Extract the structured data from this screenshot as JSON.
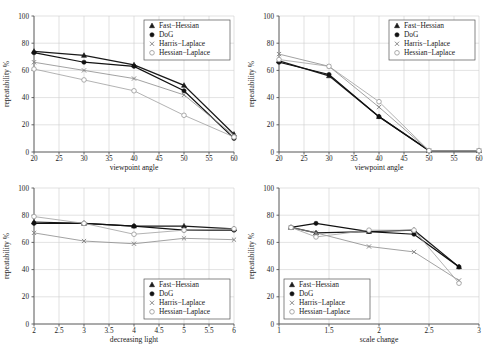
{
  "figure": {
    "series_names": [
      "Fast-Hessian",
      "DoG",
      "Harris-Laplace",
      "Hessian-Laplace"
    ],
    "legend_labels": {
      "fast_hessian": "Fast−Hessian",
      "dog": "DoG",
      "harris_laplace": "Harris−Laplace",
      "hessian_laplace": "Hessian−Laplace"
    },
    "markers": {
      "fast_hessian": "filled-triangle",
      "dog": "filled-circle",
      "harris_laplace": "cross-x",
      "hessian_laplace": "open-circle"
    },
    "colors": {
      "fast_hessian": "#1a1a1a",
      "dog": "#111111",
      "harris_laplace": "#8a8a8a",
      "hessian_laplace": "#a0a0a0",
      "grid": "#cfcfcf",
      "axis": "#555555",
      "background": "#ffffff"
    },
    "ylabel": "repeatability %",
    "yticks": [
      "0",
      "20",
      "40",
      "60",
      "80",
      "100"
    ]
  },
  "chart_data": [
    {
      "id": "viewpoint-angle-graffiti",
      "type": "line",
      "title": "",
      "xlabel": "viewpoint angle",
      "ylabel": "repeatability %",
      "xlim": [
        20,
        60
      ],
      "ylim": [
        0,
        100
      ],
      "xticks": [
        20,
        25,
        30,
        35,
        40,
        45,
        50,
        55,
        60
      ],
      "xtick_labels": [
        "20",
        "25",
        "30",
        "35",
        "40",
        "45",
        "50",
        "55",
        "60"
      ],
      "yticks": [
        0,
        20,
        40,
        60,
        80,
        100
      ],
      "ytick_labels": [
        "0",
        "20",
        "40",
        "60",
        "80",
        "100"
      ],
      "grid": true,
      "legend_position": "top-right",
      "x": [
        20,
        30,
        40,
        50,
        60
      ],
      "series": [
        {
          "name": "Fast-Hessian",
          "values": [
            74,
            71,
            64,
            49,
            13
          ]
        },
        {
          "name": "DoG",
          "values": [
            73,
            66,
            63,
            45,
            10
          ]
        },
        {
          "name": "Harris-Laplace",
          "values": [
            66,
            60,
            54,
            42,
            12
          ]
        },
        {
          "name": "Hessian-Laplace",
          "values": [
            61,
            53,
            45,
            27,
            11
          ]
        }
      ]
    },
    {
      "id": "viewpoint-angle-wall",
      "type": "line",
      "title": "",
      "xlabel": "viewpoint angle",
      "ylabel": "repeatability %",
      "xlim": [
        20,
        60
      ],
      "ylim": [
        0,
        100
      ],
      "xticks": [
        20,
        25,
        30,
        35,
        40,
        45,
        50,
        55,
        60
      ],
      "xtick_labels": [
        "20",
        "25",
        "30",
        "35",
        "40",
        "45",
        "50",
        "55",
        "60"
      ],
      "yticks": [
        0,
        20,
        40,
        60,
        80,
        100
      ],
      "ytick_labels": [
        "0",
        "20",
        "40",
        "60",
        "80",
        "100"
      ],
      "grid": true,
      "legend_position": "top-right",
      "x": [
        20,
        30,
        40,
        50,
        60
      ],
      "series": [
        {
          "name": "Fast-Hessian",
          "values": [
            67,
            56,
            26,
            1,
            1
          ]
        },
        {
          "name": "DoG",
          "values": [
            66,
            57,
            26,
            1,
            1
          ]
        },
        {
          "name": "Harris-Laplace",
          "values": [
            72,
            63,
            33,
            1,
            1
          ]
        },
        {
          "name": "Hessian-Laplace",
          "values": [
            68,
            63,
            37,
            1,
            1
          ]
        }
      ]
    },
    {
      "id": "decreasing-light",
      "type": "line",
      "title": "",
      "xlabel": "decreasing light",
      "ylabel": "repeatability %",
      "xlim": [
        2,
        6
      ],
      "ylim": [
        0,
        100
      ],
      "xticks": [
        2,
        2.5,
        3,
        3.5,
        4,
        4.5,
        5,
        5.5,
        6
      ],
      "xtick_labels": [
        "2",
        "2.5",
        "3",
        "3.5",
        "4",
        "4.5",
        "5",
        "5.5",
        "6"
      ],
      "yticks": [
        0,
        20,
        40,
        60,
        80,
        100
      ],
      "ytick_labels": [
        "0",
        "20",
        "40",
        "60",
        "80",
        "100"
      ],
      "grid": true,
      "legend_position": "bottom-right",
      "x": [
        2,
        3,
        4,
        5,
        6
      ],
      "series": [
        {
          "name": "Fast-Hessian",
          "values": [
            75,
            74,
            72,
            72,
            70
          ]
        },
        {
          "name": "DoG",
          "values": [
            74,
            74,
            72,
            69,
            69
          ]
        },
        {
          "name": "Harris-Laplace",
          "values": [
            67,
            61,
            59,
            63,
            62
          ]
        },
        {
          "name": "Hessian-Laplace",
          "values": [
            79,
            74,
            66,
            69,
            70
          ]
        }
      ]
    },
    {
      "id": "scale-change",
      "type": "line",
      "title": "",
      "xlabel": "scale change",
      "ylabel": "repeatability %",
      "xlim": [
        1,
        3
      ],
      "ylim": [
        0,
        100
      ],
      "xticks": [
        1,
        1.5,
        2,
        2.5,
        3
      ],
      "xtick_labels": [
        "1",
        "1.5",
        "2",
        "2.5",
        "3"
      ],
      "yticks": [
        0,
        20,
        40,
        60,
        80,
        100
      ],
      "ytick_labels": [
        "0",
        "20",
        "40",
        "60",
        "80",
        "100"
      ],
      "grid": true,
      "legend_position": "bottom-left",
      "x": [
        1.12,
        1.37,
        1.9,
        2.35,
        2.8
      ],
      "series": [
        {
          "name": "Fast-Hessian",
          "values": [
            71,
            67,
            68,
            69,
            42
          ]
        },
        {
          "name": "DoG",
          "values": [
            71,
            74,
            68,
            66,
            42
          ]
        },
        {
          "name": "Harris-Laplace",
          "values": [
            71,
            67,
            57,
            53,
            32
          ]
        },
        {
          "name": "Hessian-Laplace",
          "values": [
            71,
            64,
            69,
            69,
            30
          ]
        }
      ]
    }
  ]
}
